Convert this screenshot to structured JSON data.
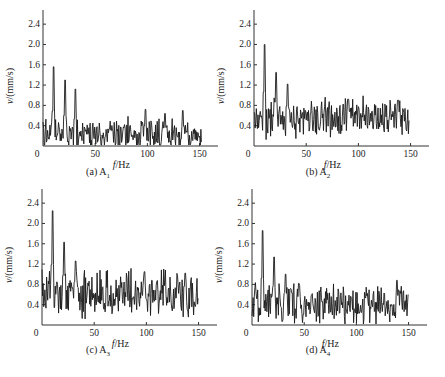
{
  "chart_data": [
    {
      "type": "line",
      "panel_label": "(a)",
      "caption": "(a) A",
      "caption_sub": "1",
      "xlabel": "f/Hz",
      "ylabel": "v/(mm/s)",
      "xlim": [
        0,
        160
      ],
      "ylim": [
        0,
        2.6
      ],
      "xticks": [
        0,
        50,
        100,
        150
      ],
      "yticks": [
        0.4,
        0.8,
        1.2,
        1.6,
        2.0,
        2.4
      ],
      "grid": false,
      "base_level": 0.22,
      "noise_amp": 0.32,
      "seed": 11,
      "x_max_data": 152,
      "peaks": [
        {
          "x": 10,
          "y": 1.56
        },
        {
          "x": 21,
          "y": 1.3
        },
        {
          "x": 31,
          "y": 1.12
        },
        {
          "x": 98,
          "y": 0.72
        },
        {
          "x": 117,
          "y": 0.64
        },
        {
          "x": 134,
          "y": 0.7
        }
      ]
    },
    {
      "type": "line",
      "panel_label": "(b)",
      "caption": "(b) A",
      "caption_sub": "2",
      "xlabel": "f/Hz",
      "ylabel": "v/(mm/s)",
      "xlim": [
        0,
        160
      ],
      "ylim": [
        0,
        2.6
      ],
      "xticks": [
        0,
        50,
        100,
        150
      ],
      "yticks": [
        0.4,
        0.8,
        1.2,
        1.6,
        2.0,
        2.4
      ],
      "grid": false,
      "base_level": 0.55,
      "noise_amp": 0.38,
      "seed": 23,
      "x_max_data": 149,
      "peaks": [
        {
          "x": 10,
          "y": 2.0
        },
        {
          "x": 21,
          "y": 1.45
        },
        {
          "x": 32,
          "y": 1.22
        },
        {
          "x": 90,
          "y": 0.92
        },
        {
          "x": 138,
          "y": 0.9
        }
      ]
    },
    {
      "type": "line",
      "panel_label": "(c)",
      "caption": "(c) A",
      "caption_sub": "3",
      "xlabel": "f/Hz",
      "ylabel": "v/(mm/s)",
      "xlim": [
        0,
        160
      ],
      "ylim": [
        0,
        2.6
      ],
      "xticks": [
        0,
        50,
        100,
        150
      ],
      "yticks": [
        0.4,
        0.8,
        1.2,
        1.6,
        2.0,
        2.4
      ],
      "grid": false,
      "base_level": 0.62,
      "noise_amp": 0.45,
      "seed": 37,
      "x_max_data": 150,
      "peaks": [
        {
          "x": 10,
          "y": 2.25
        },
        {
          "x": 21,
          "y": 1.63
        },
        {
          "x": 32,
          "y": 1.26
        },
        {
          "x": 98,
          "y": 1.05
        },
        {
          "x": 137,
          "y": 1.02
        }
      ]
    },
    {
      "type": "line",
      "panel_label": "(d)",
      "caption": "(d) A",
      "caption_sub": "4",
      "xlabel": "f/Hz",
      "ylabel": "v/(mm/s)",
      "xlim": [
        0,
        160
      ],
      "ylim": [
        0,
        2.6
      ],
      "xticks": [
        0,
        50,
        100,
        150
      ],
      "yticks": [
        0.4,
        0.8,
        1.2,
        1.6,
        2.0,
        2.4
      ],
      "grid": false,
      "base_level": 0.42,
      "noise_amp": 0.38,
      "seed": 51,
      "x_max_data": 150,
      "peaks": [
        {
          "x": 10,
          "y": 1.86
        },
        {
          "x": 21,
          "y": 1.34
        },
        {
          "x": 32,
          "y": 1.0
        },
        {
          "x": 45,
          "y": 0.82
        },
        {
          "x": 139,
          "y": 0.88
        }
      ]
    }
  ],
  "layout": {
    "line_color": "#1a1a1a",
    "axis_color": "#333333"
  }
}
